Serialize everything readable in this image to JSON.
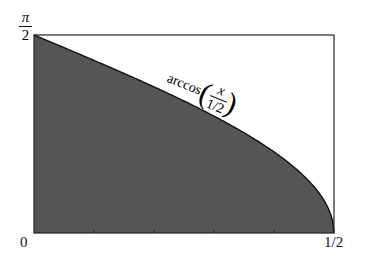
{
  "chart_data": {
    "type": "area",
    "title": "",
    "xlabel": "",
    "ylabel": "",
    "xlim": [
      0,
      0.5
    ],
    "ylim": [
      0,
      1.5708
    ],
    "x_ticks": [
      {
        "value": 0,
        "label": "0"
      },
      {
        "value": 0.5,
        "label": "1/2"
      }
    ],
    "y_ticks": [
      {
        "value": 1.5708,
        "label": "π/2"
      }
    ],
    "series": [
      {
        "name": "arccos(x/(1/2))",
        "function": "arccos(2x)",
        "fill": "#555555",
        "x": [
          0,
          0.05,
          0.1,
          0.15,
          0.2,
          0.25,
          0.3,
          0.35,
          0.4,
          0.45,
          0.5
        ],
        "y": [
          1.5708,
          1.4706,
          1.3694,
          1.2661,
          1.1593,
          1.0472,
          0.9273,
          0.7954,
          0.6435,
          0.451,
          0
        ]
      }
    ],
    "annotations": [
      {
        "text": "arccos(x / (1/2))",
        "position": "above curve near x=0.3"
      }
    ],
    "grid": false,
    "legend": "none"
  },
  "labels": {
    "y_top_num": "π",
    "y_top_den": "2",
    "x_left": "0",
    "y_bottom": "0",
    "x_right": "1/2",
    "curve_func": "arccos",
    "curve_num": "x",
    "curve_den": "1/2"
  }
}
